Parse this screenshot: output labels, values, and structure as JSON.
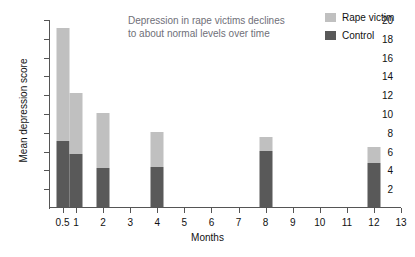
{
  "chart_data": {
    "type": "bar",
    "stacked": true,
    "title": "",
    "annotation": "Depression in rape victims declines\nto about normal levels over time",
    "xlabel": "Months",
    "ylabel": "Mean depression score",
    "categories": [
      "0.5",
      "1",
      "2",
      "4",
      "8",
      "12"
    ],
    "x": [
      0.5,
      1,
      2,
      4,
      8,
      12
    ],
    "series": [
      {
        "name": "Control",
        "color": "#595959",
        "values": [
          7.0,
          5.6,
          4.2,
          4.3,
          6.0,
          4.7
        ]
      },
      {
        "name": "Rape victim",
        "color": "#c0c0c0",
        "values": [
          12.0,
          6.5,
          5.8,
          3.7,
          1.5,
          1.7
        ]
      }
    ],
    "totals": [
      19.0,
      12.1,
      10.0,
      8.0,
      7.5,
      6.4
    ],
    "ylim": [
      0,
      20
    ],
    "yticks": [
      2,
      4,
      6,
      8,
      10,
      12,
      14,
      16,
      18,
      20
    ],
    "xlim": [
      0,
      13
    ],
    "xticks": [
      0.5,
      1,
      2,
      3,
      4,
      5,
      6,
      7,
      8,
      9,
      10,
      11,
      12,
      13
    ],
    "xticklabels": [
      "0.5",
      "1",
      "2",
      "3",
      "4",
      "5",
      "6",
      "7",
      "8",
      "9",
      "10",
      "11",
      "12",
      "13"
    ],
    "grid": false,
    "legend_position": "top-right",
    "legend": [
      {
        "label": "Rape victim",
        "color": "#c0c0c0"
      },
      {
        "label": "Control",
        "color": "#595959"
      }
    ]
  }
}
